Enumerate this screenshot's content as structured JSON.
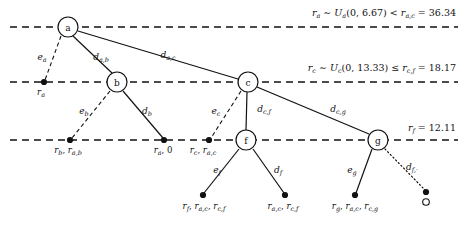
{
  "figure": {
    "type": "tree-diagram",
    "background": "#ffffff",
    "ink": "#111111",
    "width": 473,
    "height": 226
  },
  "levels": [
    {
      "id": "level-a",
      "y": 27,
      "style": "dashed",
      "annotation": "ra ~ Ua(0, 6.67) < ra,c = 36.34",
      "annotation_parts": {
        "var": "r",
        "var_sub": "a",
        "rel1": "∼",
        "dist": "U",
        "dist_sub": "a",
        "range": "(0, 6.67)",
        "rel2": "<",
        "bound_var": "r",
        "bound_sub": "a,c",
        "eq": "=",
        "value": "36.34"
      }
    },
    {
      "id": "level-c",
      "y": 82,
      "style": "dashed",
      "annotation": "rc ~ Uc(0, 13.33) ≤ rc,f = 18.17",
      "annotation_parts": {
        "var": "r",
        "var_sub": "c",
        "rel1": "∼",
        "dist": "U",
        "dist_sub": "c",
        "range": "(0, 13.33)",
        "rel2": "≤",
        "bound_var": "r",
        "bound_sub": "c,f",
        "eq": "=",
        "value": "18.17"
      }
    },
    {
      "id": "level-f",
      "y": 140,
      "style": "dashed",
      "annotation": "rf = 12.11",
      "annotation_parts": {
        "var": "r",
        "var_sub": "f",
        "eq": "=",
        "value": "12.11"
      }
    }
  ],
  "nodes": [
    {
      "id": "a",
      "label": "a",
      "x": 68,
      "y": 27,
      "r": 10,
      "kind": "circle"
    },
    {
      "id": "b",
      "label": "b",
      "x": 117,
      "y": 82,
      "r": 10,
      "kind": "circle"
    },
    {
      "id": "c",
      "label": "c",
      "x": 248,
      "y": 82,
      "r": 10,
      "kind": "circle"
    },
    {
      "id": "f",
      "label": "f",
      "x": 246,
      "y": 140,
      "r": 10,
      "kind": "circle"
    },
    {
      "id": "g",
      "label": "g",
      "x": 378,
      "y": 140,
      "r": 10,
      "kind": "circle"
    }
  ],
  "leaves": [
    {
      "id": "leaf-ra",
      "x": 44,
      "y": 82,
      "filled": true,
      "label": "ra",
      "label_x": 41,
      "label_y": 95,
      "anchor": "middle"
    },
    {
      "id": "leaf-b",
      "x": 70,
      "y": 140,
      "filled": true,
      "label": "rb, ra,b",
      "label_x": 68,
      "label_y": 153,
      "anchor": "middle"
    },
    {
      "id": "leaf-db",
      "x": 164,
      "y": 140,
      "filled": true,
      "label": "ra, 0",
      "label_x": 163,
      "label_y": 153,
      "anchor": "middle"
    },
    {
      "id": "leaf-c",
      "x": 209,
      "y": 140,
      "filled": true,
      "label": "rc, ra,c",
      "label_x": 203,
      "label_y": 153,
      "anchor": "middle"
    },
    {
      "id": "leaf-ef",
      "x": 203,
      "y": 195,
      "filled": true,
      "label": "rf, ra,c, rc,f",
      "label_x": 204,
      "label_y": 209,
      "anchor": "middle"
    },
    {
      "id": "leaf-df",
      "x": 285,
      "y": 195,
      "filled": true,
      "label": "ra,c, rc,f",
      "label_x": 283,
      "label_y": 209,
      "anchor": "middle"
    },
    {
      "id": "leaf-eg",
      "x": 355,
      "y": 195,
      "filled": true,
      "label": "rg, ra,c, rc,g",
      "label_x": 355,
      "label_y": 209,
      "anchor": "middle"
    },
    {
      "id": "leaf-dfd",
      "x": 426,
      "y": 193,
      "filled": false,
      "label": "",
      "label_x": 426,
      "label_y": 209,
      "anchor": "middle"
    }
  ],
  "edges": [
    {
      "id": "edge-ea",
      "from": "a",
      "to": "leaf-ra",
      "style": "dashed",
      "label": "ea",
      "label_x": 42,
      "label_y": 60
    },
    {
      "id": "edge-dab",
      "from": "a",
      "to": "b",
      "style": "solid",
      "label": "da,b",
      "label_x": 101,
      "label_y": 60
    },
    {
      "id": "edge-dac",
      "from": "a",
      "to": "c",
      "style": "solid",
      "label": "da,c",
      "label_x": 166,
      "label_y": 58
    },
    {
      "id": "edge-eb",
      "from": "b",
      "to": "leaf-b",
      "style": "dashed",
      "label": "eb",
      "label_x": 84,
      "label_y": 114
    },
    {
      "id": "edge-db",
      "from": "b",
      "to": "leaf-db",
      "style": "solid",
      "label": "db",
      "label_x": 146,
      "label_y": 114
    },
    {
      "id": "edge-ec",
      "from": "c",
      "to": "leaf-c",
      "style": "dashed",
      "label": "ec",
      "label_x": 215,
      "label_y": 114
    },
    {
      "id": "edge-dcf",
      "from": "c",
      "to": "f",
      "style": "solid",
      "label": "dc,f",
      "label_x": 262,
      "label_y": 112
    },
    {
      "id": "edge-dcg",
      "from": "c",
      "to": "g",
      "style": "solid",
      "label": "dc,g",
      "label_x": 336,
      "label_y": 112
    },
    {
      "id": "edge-ef",
      "from": "f",
      "to": "leaf-ef",
      "style": "solid",
      "label": "ef",
      "label_x": 217,
      "label_y": 172
    },
    {
      "id": "edge-df",
      "from": "f",
      "to": "leaf-df",
      "style": "solid",
      "label": "df",
      "label_x": 277,
      "label_y": 172
    },
    {
      "id": "edge-eg",
      "from": "g",
      "to": "leaf-eg",
      "style": "solid",
      "label": "eg",
      "label_x": 352,
      "label_y": 172
    },
    {
      "id": "edge-dfd",
      "from": "g",
      "to": "leaf-dfd",
      "style": "dotted",
      "label": "df,·",
      "label_x": 410,
      "label_y": 170
    }
  ]
}
